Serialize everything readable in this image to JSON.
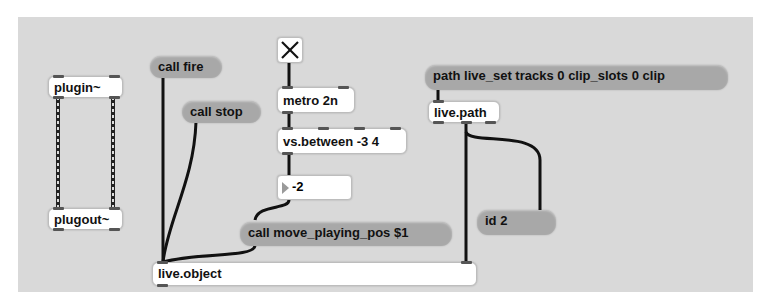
{
  "patcher": {
    "background": "#d9d9d9",
    "objects": {
      "plugin": "plugin~",
      "plugout": "plugout~",
      "metro": "metro 2n",
      "between": "vs.between -3 4",
      "live_path": "live.path",
      "live_object": "live.object"
    },
    "messages": {
      "call_fire": "call fire",
      "call_stop": "call stop",
      "call_move": "call move_playing_pos $1",
      "path": "path live_set tracks 0 clip_slots 0 clip",
      "id": "id 2"
    },
    "toggle": {
      "state": "on"
    },
    "number_box": {
      "value": "-2"
    },
    "colors": {
      "cord": "#111111",
      "message_fill": "#a8a8a8",
      "object_fill": "#ffffff"
    }
  }
}
